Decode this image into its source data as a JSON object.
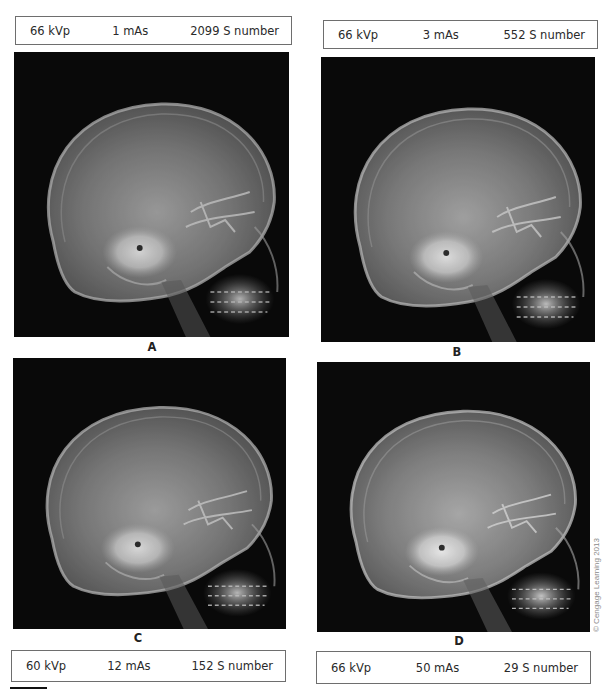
{
  "figure": {
    "panels": [
      {
        "id": "A",
        "label": "A",
        "kvp": "66 kVp",
        "mas": "1 mAs",
        "s_number": "2099 S number",
        "brightness": 0.82
      },
      {
        "id": "B",
        "label": "B",
        "kvp": "66 kVp",
        "mas": "3 mAs",
        "s_number": "552 S number",
        "brightness": 0.86
      },
      {
        "id": "C",
        "label": "C",
        "kvp": "60 kVp",
        "mas": "12 mAs",
        "s_number": "152 S number",
        "brightness": 0.84
      },
      {
        "id": "D",
        "label": "D",
        "kvp": "66 kVp",
        "mas": "50 mAs",
        "s_number": "29 S number",
        "brightness": 0.9
      }
    ],
    "image_description": "Lateral skull radiograph",
    "copyright": "© Cengage Learning 2013"
  },
  "colors": {
    "background": "#ffffff",
    "image_background": "#0b0b0b",
    "box_border": "#6e6e6e",
    "text": "#2a2a2a"
  }
}
